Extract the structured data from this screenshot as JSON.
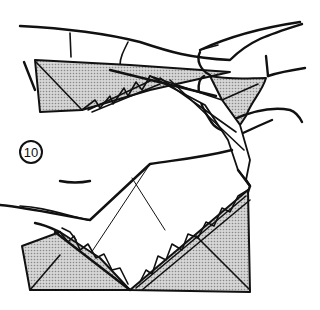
{
  "diagram": {
    "step_number": "10",
    "colors": {
      "ink": "#111111",
      "paper_shade": "#bdbdbd",
      "background": "#ffffff"
    },
    "elements": [
      "upper-hand-fingers",
      "upper-left-folded-flap",
      "right-hand-pinch",
      "lower-hand",
      "lower-left-triangle-flap",
      "lower-right-triangle-flap",
      "pleated-edges"
    ]
  }
}
